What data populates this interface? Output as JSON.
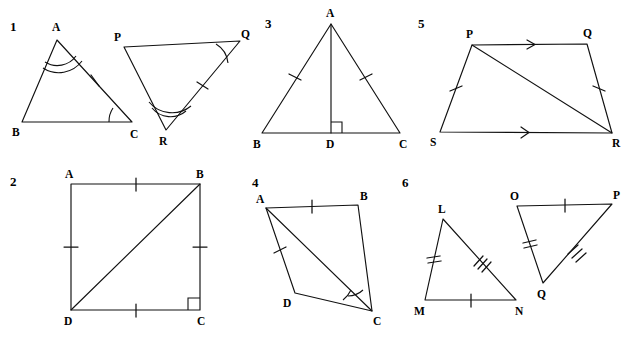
{
  "page": {
    "background_color": "#ffffff",
    "ink_color": "#111111",
    "width": 628,
    "height": 342
  },
  "problems": [
    {
      "number": "1",
      "description": "Two triangles ABC and PQR with marked congruent angles and sides",
      "figures": [
        {
          "name": "triangle-abc",
          "vertices": [
            {
              "label": "A",
              "x": 57,
              "y": 40
            },
            {
              "label": "B",
              "x": 22,
              "y": 122
            },
            {
              "label": "C",
              "x": 132,
              "y": 122
            }
          ],
          "marks": [
            "double-arc-at-A",
            "single-arc-at-C",
            "single-tick-on-AC"
          ]
        },
        {
          "name": "triangle-pqr",
          "vertices": [
            {
              "label": "P",
              "x": 124,
              "y": 47
            },
            {
              "label": "Q",
              "x": 240,
              "y": 41
            },
            {
              "label": "R",
              "x": 166,
              "y": 130
            }
          ],
          "marks": [
            "double-arc-at-R",
            "single-arc-at-Q",
            "single-tick-on-QR"
          ]
        }
      ]
    },
    {
      "number": "2",
      "description": "Square ABCD with diagonal DB and a right angle at C",
      "figures": [
        {
          "name": "square-abcd",
          "vertices": [
            {
              "label": "A",
              "x": 71,
              "y": 184
            },
            {
              "label": "B",
              "x": 200,
              "y": 184
            },
            {
              "label": "C",
              "x": 200,
              "y": 310
            },
            {
              "label": "D",
              "x": 71,
              "y": 310
            }
          ],
          "marks": [
            "single-tick-on-AB",
            "single-tick-on-BC",
            "single-tick-on-CD",
            "single-tick-on-DA",
            "diagonal-DB",
            "right-angle-at-C"
          ]
        }
      ]
    },
    {
      "number": "3",
      "description": "Isosceles triangle ABC with altitude AD perpendicular to BC",
      "figures": [
        {
          "name": "triangle-abc-altitude",
          "vertices": [
            {
              "label": "A",
              "x": 331,
              "y": 24
            },
            {
              "label": "B",
              "x": 262,
              "y": 133
            },
            {
              "label": "C",
              "x": 400,
              "y": 133
            },
            {
              "label": "D",
              "x": 331,
              "y": 133
            }
          ],
          "marks": [
            "single-tick-on-AB",
            "single-tick-on-AC",
            "altitude-AD",
            "right-angle-at-D"
          ]
        }
      ]
    },
    {
      "number": "4",
      "description": "Quadrilateral ABCD with diagonal AC and double angle arcs at C",
      "figures": [
        {
          "name": "quadrilateral-abcd",
          "vertices": [
            {
              "label": "A",
              "x": 266,
              "y": 208
            },
            {
              "label": "B",
              "x": 358,
              "y": 205
            },
            {
              "label": "C",
              "x": 372,
              "y": 311
            },
            {
              "label": "D",
              "x": 295,
              "y": 293
            }
          ],
          "marks": [
            "single-tick-on-AB",
            "single-tick-on-AD",
            "diagonal-AC",
            "double-arc-at-C"
          ]
        }
      ]
    },
    {
      "number": "5",
      "description": "Trapezium PQRS with PQ parallel to SR and diagonal PR",
      "figures": [
        {
          "name": "trapezium-pqrs",
          "vertices": [
            {
              "label": "P",
              "x": 472,
              "y": 45
            },
            {
              "label": "Q",
              "x": 587,
              "y": 44
            },
            {
              "label": "R",
              "x": 612,
              "y": 133
            },
            {
              "label": "S",
              "x": 440,
              "y": 132
            }
          ],
          "marks": [
            "arrow-on-PQ",
            "arrow-on-SR",
            "single-tick-on-PS",
            "single-tick-on-QR",
            "diagonal-PR"
          ]
        }
      ]
    },
    {
      "number": "6",
      "description": "Two triangles LMN and OPQ with matching tick marks",
      "figures": [
        {
          "name": "triangle-lmn",
          "vertices": [
            {
              "label": "L",
              "x": 443,
              "y": 219
            },
            {
              "label": "M",
              "x": 425,
              "y": 300
            },
            {
              "label": "N",
              "x": 516,
              "y": 300
            }
          ],
          "marks": [
            "double-tick-on-LM",
            "triple-tick-on-LN",
            "single-tick-on-MN"
          ]
        },
        {
          "name": "triangle-opq",
          "vertices": [
            {
              "label": "O",
              "x": 517,
              "y": 206
            },
            {
              "label": "P",
              "x": 612,
              "y": 204
            },
            {
              "label": "Q",
              "x": 543,
              "y": 283
            }
          ],
          "marks": [
            "single-tick-on-OP",
            "double-tick-on-OQ",
            "triple-tick-on-PQ"
          ]
        }
      ]
    }
  ]
}
